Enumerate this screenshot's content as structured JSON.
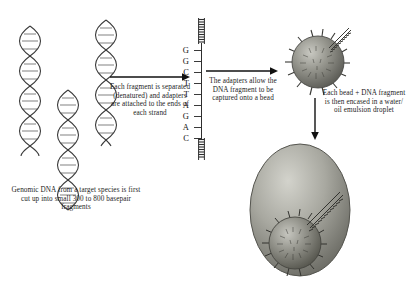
{
  "figure": {
    "background_color": "#ffffff",
    "ink_color": "#1c1c1c"
  },
  "captions": {
    "genomic_dna": "Genomic DNA from a target species is first cut up into small 300 to 800 basepair fragments",
    "step1_arrow": "Each fragment is separated (denatured) and adapters are attached to the ends of each strand",
    "step2_arrow": "The adapters allow the DNA fragment to be captured onto a bead",
    "step3_arrow": "Each bead + DNA fragment is then encased in a water/ oil emulsion droplet"
  },
  "sequence": {
    "label": "single-stranded DNA fragment bases",
    "bases": [
      "G",
      "G",
      "C",
      "T",
      "T",
      "A",
      "G",
      "A",
      "C"
    ],
    "top_adapter": "adapter",
    "bottom_adapter": "adapter"
  },
  "objects": {
    "dna_helix_1": "double-stranded DNA fragment",
    "dna_helix_2": "double-stranded DNA fragment",
    "dna_helix_3": "double-stranded DNA fragment",
    "bead_small": "DNA capture bead",
    "bead_in_droplet": "DNA capture bead inside emulsion droplet",
    "droplet": "water/oil emulsion droplet"
  },
  "colors": {
    "bead_fill": "#8d8d86",
    "bead_edge": "#4a4a46",
    "droplet_fill": "#a6a69e",
    "droplet_edge": "#55554f",
    "arrow": "#111111",
    "helix": "#3c3c3c"
  }
}
